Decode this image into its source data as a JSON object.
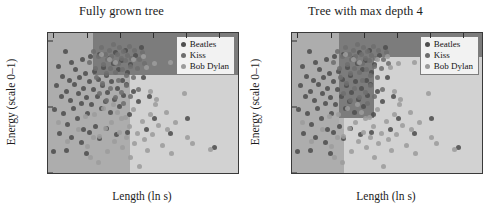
{
  "figure": {
    "background": "#ffffff",
    "xlabel": "Length (ln s)",
    "ylabel": "Energy (scale 0–1)"
  },
  "colors": {
    "region_beatles": "#7c7c7c",
    "region_kiss": "#adadad",
    "region_bobdylan": "#d2d2d2",
    "dot_beatles": "#4f4f4f",
    "dot_kiss": "#6e6e6e",
    "dot_bobdylan": "#9c9c9c",
    "axis": "#333333",
    "legend_bg": "#f2f2f2",
    "legend_border": "#7d7d7d"
  },
  "legend": {
    "items": [
      {
        "label": "Beatles",
        "color": "#4f4f4f"
      },
      {
        "label": "Kiss",
        "color": "#6e6e6e"
      },
      {
        "label": "Bob Dylan",
        "color": "#9c9c9c"
      }
    ]
  },
  "panels": [
    {
      "id": "left",
      "title": "Fully grown tree"
    },
    {
      "id": "right",
      "title": "Tree with max depth 4"
    }
  ],
  "chart_data": {
    "type": "scatter",
    "xlabel": "Length (ln s)",
    "ylabel": "Energy (scale 0–1)",
    "xlim": [
      4.42,
      7.28
    ],
    "ylim": [
      0.0,
      1.06
    ],
    "xticks": [
      4.5,
      5,
      5.5,
      6,
      6.5,
      7
    ],
    "xticklabels": [
      "4.5",
      "5",
      "5.5",
      "6",
      "6.5",
      "7"
    ],
    "yticks": [
      0,
      0.5,
      1
    ],
    "yticklabels": [
      "0",
      "0.5",
      "1"
    ],
    "grid": false,
    "legend_position": "top-right",
    "legend_entries": [
      "Beatles",
      "Kiss",
      "Bob Dylan"
    ],
    "subplots": [
      {
        "name": "Fully grown tree",
        "model": "decision tree, unpruned"
      },
      {
        "name": "Tree with max depth 4",
        "model": "decision tree, max_depth=4"
      }
    ],
    "series": [
      {
        "name": "Beatles",
        "color": "#4f4f4f",
        "points": [
          [
            4.52,
            0.48
          ],
          [
            4.55,
            0.66
          ],
          [
            4.58,
            0.81
          ],
          [
            4.62,
            0.58
          ],
          [
            4.64,
            0.73
          ],
          [
            4.66,
            0.45
          ],
          [
            4.68,
            0.92
          ],
          [
            4.7,
            0.62
          ],
          [
            4.72,
            0.37
          ],
          [
            4.74,
            0.7
          ],
          [
            4.76,
            0.55
          ],
          [
            4.78,
            0.84
          ],
          [
            4.8,
            0.49
          ],
          [
            4.82,
            0.67
          ],
          [
            4.84,
            0.78
          ],
          [
            4.86,
            0.41
          ],
          [
            4.88,
            0.6
          ],
          [
            4.9,
            0.72
          ],
          [
            4.92,
            0.53
          ],
          [
            4.94,
            0.86
          ],
          [
            4.95,
            0.33
          ],
          [
            4.96,
            0.64
          ],
          [
            4.98,
            0.75
          ],
          [
            5.0,
            0.57
          ],
          [
            5.02,
            0.45
          ],
          [
            5.04,
            0.69
          ],
          [
            5.06,
            0.88
          ],
          [
            5.08,
            0.52
          ],
          [
            5.1,
            0.63
          ],
          [
            5.12,
            0.77
          ],
          [
            5.14,
            0.35
          ],
          [
            5.16,
            0.58
          ],
          [
            5.18,
            0.71
          ],
          [
            5.2,
            0.9
          ],
          [
            5.22,
            0.49
          ],
          [
            5.24,
            0.66
          ],
          [
            5.26,
            0.8
          ],
          [
            5.28,
            0.54
          ],
          [
            5.3,
            0.74
          ],
          [
            5.32,
            0.61
          ],
          [
            5.34,
            0.87
          ],
          [
            5.36,
            0.46
          ],
          [
            5.38,
            0.69
          ],
          [
            5.4,
            0.83
          ],
          [
            5.42,
            0.56
          ],
          [
            5.44,
            0.91
          ],
          [
            5.46,
            0.64
          ],
          [
            5.48,
            0.78
          ],
          [
            5.5,
            0.5
          ],
          [
            5.52,
            0.85
          ],
          [
            5.54,
            0.7
          ],
          [
            5.56,
            0.59
          ],
          [
            5.58,
            0.93
          ],
          [
            5.6,
            0.67
          ],
          [
            5.62,
            0.76
          ],
          [
            5.64,
            0.44
          ],
          [
            5.66,
            0.82
          ],
          [
            5.7,
            0.62
          ],
          [
            5.74,
            0.89
          ],
          [
            5.78,
            0.54
          ],
          [
            5.82,
            0.95
          ],
          [
            5.86,
            0.72
          ],
          [
            5.9,
            0.33
          ],
          [
            5.95,
            0.58
          ],
          [
            6.02,
            0.41
          ],
          [
            4.6,
            0.3
          ],
          [
            4.78,
            0.27
          ],
          [
            4.92,
            0.23
          ],
          [
            5.05,
            0.31
          ],
          [
            5.2,
            0.26
          ],
          [
            4.7,
            0.17
          ],
          [
            5.0,
            0.15
          ],
          [
            5.3,
            0.34
          ],
          [
            5.45,
            0.29
          ],
          [
            5.62,
            0.31
          ],
          [
            6.26,
            0.3
          ],
          [
            6.52,
            0.41
          ],
          [
            6.93,
            0.19
          ],
          [
            4.5,
            0.16
          ]
        ]
      },
      {
        "name": "Kiss",
        "color": "#6e6e6e",
        "points": [
          [
            5.05,
            0.84
          ],
          [
            5.1,
            0.92
          ],
          [
            5.14,
            0.79
          ],
          [
            5.18,
            0.88
          ],
          [
            5.22,
            0.95
          ],
          [
            5.26,
            0.82
          ],
          [
            5.28,
            0.9
          ],
          [
            5.3,
            0.75
          ],
          [
            5.32,
            0.86
          ],
          [
            5.34,
            0.93
          ],
          [
            5.36,
            0.79
          ],
          [
            5.38,
            0.88
          ],
          [
            5.4,
            0.97
          ],
          [
            5.42,
            0.84
          ],
          [
            5.44,
            0.76
          ],
          [
            5.46,
            0.9
          ],
          [
            5.48,
            0.83
          ],
          [
            5.5,
            0.95
          ],
          [
            5.52,
            0.87
          ],
          [
            5.54,
            0.78
          ],
          [
            5.56,
            0.92
          ],
          [
            5.58,
            0.85
          ],
          [
            5.6,
            0.74
          ],
          [
            5.62,
            0.89
          ],
          [
            5.64,
            0.96
          ],
          [
            5.66,
            0.81
          ],
          [
            5.68,
            0.87
          ],
          [
            5.72,
            0.93
          ],
          [
            5.76,
            0.79
          ],
          [
            5.8,
            0.86
          ],
          [
            5.84,
            0.91
          ],
          [
            5.88,
            0.83
          ],
          [
            5.24,
            0.68
          ],
          [
            5.36,
            0.64
          ],
          [
            5.48,
            0.7
          ],
          [
            5.52,
            0.61
          ],
          [
            5.6,
            0.66
          ],
          [
            5.7,
            0.72
          ],
          [
            5.78,
            0.63
          ],
          [
            5.15,
            0.72
          ],
          [
            5.44,
            0.57
          ],
          [
            5.56,
            0.53
          ],
          [
            5.66,
            0.58
          ],
          [
            5.3,
            0.55
          ],
          [
            5.2,
            0.6
          ]
        ]
      },
      {
        "name": "Bob Dylan",
        "color": "#9c9c9c",
        "points": [
          [
            4.58,
            0.38
          ],
          [
            4.72,
            0.24
          ],
          [
            4.88,
            0.33
          ],
          [
            5.02,
            0.2
          ],
          [
            5.12,
            0.44
          ],
          [
            5.2,
            0.28
          ],
          [
            5.26,
            0.49
          ],
          [
            5.32,
            0.16
          ],
          [
            5.38,
            0.38
          ],
          [
            5.42,
            0.24
          ],
          [
            5.46,
            0.46
          ],
          [
            5.5,
            0.31
          ],
          [
            5.54,
            0.19
          ],
          [
            5.58,
            0.42
          ],
          [
            5.6,
            0.27
          ],
          [
            5.64,
            0.35
          ],
          [
            5.66,
            0.12
          ],
          [
            5.7,
            0.48
          ],
          [
            5.72,
            0.22
          ],
          [
            5.76,
            0.3
          ],
          [
            5.8,
            0.05
          ],
          [
            5.84,
            0.39
          ],
          [
            5.88,
            0.25
          ],
          [
            5.92,
            0.17
          ],
          [
            5.96,
            0.44
          ],
          [
            6.0,
            0.29
          ],
          [
            6.04,
            0.52
          ],
          [
            6.08,
            0.36
          ],
          [
            6.14,
            0.21
          ],
          [
            6.2,
            0.46
          ],
          [
            6.26,
            0.84
          ],
          [
            6.28,
            0.15
          ],
          [
            6.34,
            0.38
          ],
          [
            6.48,
            0.6
          ],
          [
            6.52,
            0.27
          ],
          [
            5.96,
            0.62
          ],
          [
            6.06,
            0.56
          ],
          [
            5.9,
            0.8
          ],
          [
            6.22,
            0.33
          ],
          [
            5.34,
            0.86
          ],
          [
            5.22,
            0.9
          ],
          [
            5.4,
            0.52
          ],
          [
            5.52,
            0.41
          ],
          [
            5.28,
            0.34
          ],
          [
            5.1,
            0.27
          ],
          [
            4.98,
            0.43
          ],
          [
            5.06,
            0.12
          ],
          [
            5.18,
            0.08
          ],
          [
            6.6,
            0.22
          ],
          [
            6.86,
            0.18
          ],
          [
            5.44,
            0.84
          ],
          [
            5.7,
            0.86
          ],
          [
            5.86,
            0.88
          ],
          [
            6.02,
            0.83
          ]
        ]
      }
    ],
    "regions": {
      "left_panel": [
        {
          "class": "Kiss",
          "x0": 4.42,
          "x1": 5.1,
          "y0": 0.0,
          "y1": 1.06
        },
        {
          "class": "Beatles",
          "x0": 5.1,
          "x1": 7.28,
          "y0": 0.74,
          "y1": 1.06
        },
        {
          "class": "Kiss",
          "x0": 5.1,
          "x1": 5.66,
          "y0": 0.0,
          "y1": 0.74
        },
        {
          "class": "Bob Dylan",
          "x0": 5.66,
          "x1": 7.28,
          "y0": 0.0,
          "y1": 0.74
        }
      ],
      "right_panel": [
        {
          "class": "Kiss",
          "x0": 4.42,
          "x1": 5.12,
          "y0": 0.0,
          "y1": 1.06
        },
        {
          "class": "Beatles",
          "x0": 5.12,
          "x1": 7.28,
          "y0": 0.88,
          "y1": 1.06
        },
        {
          "class": "Beatles",
          "x0": 5.12,
          "x1": 5.66,
          "y0": 0.42,
          "y1": 0.88
        },
        {
          "class": "Bob Dylan",
          "x0": 5.66,
          "x1": 7.28,
          "y0": 0.0,
          "y1": 0.88
        },
        {
          "class": "Kiss",
          "x0": 4.42,
          "x1": 5.2,
          "y0": 0.0,
          "y1": 0.33
        },
        {
          "class": "Bob Dylan",
          "x0": 5.2,
          "x1": 5.66,
          "y0": 0.0,
          "y1": 0.42
        }
      ]
    }
  }
}
